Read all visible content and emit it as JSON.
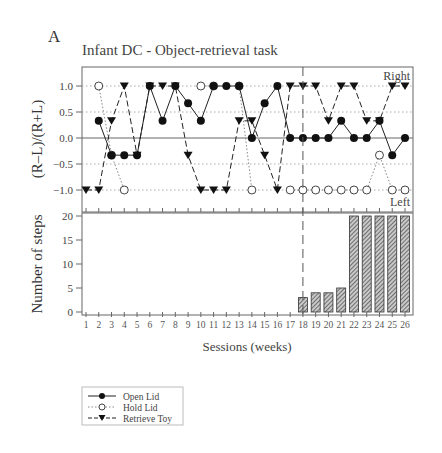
{
  "panel_label": "A",
  "title": "Infant DC - Object-retrieval task",
  "colors": {
    "axis": "#555555",
    "text": "#333333",
    "grid": "#999999",
    "bar_fill": "#bbbbbb",
    "bar_hatch": "#333333",
    "marker": "#111111"
  },
  "chart_data": [
    {
      "type": "line",
      "title": "Infant DC - Object-retrieval task",
      "xlabel": "",
      "ylabel": "(R–L)/(R+L)",
      "ylim": [
        -1.45,
        1.4
      ],
      "yticks": [
        "1.0",
        "0.5",
        "0.0",
        "−0.5",
        "−1.0"
      ],
      "ytick_values": [
        1.0,
        0.5,
        0.0,
        -0.5,
        -1.0
      ],
      "grid": "dotted horizontal at ±0.5, ±1.0; solid at 0",
      "annotations": [
        "Right",
        "Left"
      ],
      "vertical_marker_session": 18,
      "x": [
        1,
        2,
        3,
        4,
        5,
        6,
        7,
        8,
        9,
        10,
        11,
        12,
        13,
        14,
        15,
        16,
        17,
        18,
        19,
        20,
        21,
        22,
        23,
        24,
        25,
        26
      ],
      "series": [
        {
          "name": "Open Lid",
          "style": "solid, filled circle",
          "values": [
            null,
            0.33,
            -0.33,
            -0.33,
            -0.33,
            1.0,
            0.33,
            1.0,
            0.67,
            0.33,
            1.0,
            1.0,
            1.0,
            0.0,
            0.67,
            1.0,
            0.0,
            0.0,
            0.0,
            0.0,
            0.33,
            0.0,
            0.0,
            0.33,
            -0.33,
            0.0
          ]
        },
        {
          "name": "Hold Lid",
          "style": "dotted, open circle",
          "values": [
            null,
            1.0,
            -0.33,
            -1.0,
            null,
            null,
            null,
            null,
            null,
            1.0,
            1.0,
            null,
            1.0,
            -1.0,
            null,
            null,
            -1.0,
            -1.0,
            -1.0,
            -1.0,
            -1.0,
            -1.0,
            -1.0,
            -0.33,
            -1.0,
            -1.0
          ]
        },
        {
          "name": "Retrieve Toy",
          "style": "dashed, filled down-triangle",
          "values": [
            -1.0,
            -1.0,
            0.33,
            1.0,
            -0.33,
            1.0,
            1.0,
            1.0,
            -0.33,
            -1.0,
            -1.0,
            -1.0,
            0.33,
            0.33,
            -0.33,
            -1.0,
            1.0,
            1.0,
            1.0,
            0.33,
            1.0,
            1.0,
            0.33,
            0.33,
            1.0,
            1.0
          ]
        }
      ]
    },
    {
      "type": "bar",
      "title": "",
      "xlabel": "Sessions (weeks)",
      "ylabel": "Number of steps",
      "ylim": [
        0,
        20
      ],
      "yticks": [
        "20",
        "15",
        "10",
        "5",
        "0"
      ],
      "ytick_values": [
        20,
        15,
        10,
        5,
        0
      ],
      "categories": [
        "1",
        "2",
        "3",
        "4",
        "5",
        "6",
        "7",
        "8",
        "9",
        "10",
        "11",
        "12",
        "13",
        "14",
        "15",
        "16",
        "17",
        "18",
        "19",
        "20",
        "21",
        "22",
        "23",
        "24",
        "25",
        "26"
      ],
      "values": [
        0,
        0,
        0,
        0,
        0,
        0,
        0,
        0,
        0,
        0,
        0,
        0,
        0,
        0,
        0,
        0,
        0,
        3,
        4,
        4,
        5,
        20,
        20,
        20,
        20,
        20
      ],
      "bar_style": "hatched"
    }
  ],
  "legend": {
    "items": [
      {
        "label": "Open Lid",
        "marker": "filled-circle",
        "line": "solid"
      },
      {
        "label": "Hold Lid",
        "marker": "open-circle",
        "line": "dotted"
      },
      {
        "label": "Retrieve Toy",
        "marker": "filled-down-triangle",
        "line": "dashed"
      }
    ]
  }
}
